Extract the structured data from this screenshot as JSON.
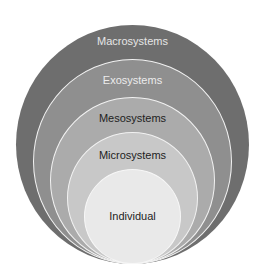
{
  "diagram": {
    "type": "nested-circles",
    "levels": [
      {
        "label": "Macrosystems",
        "fill": "#6e6e6e",
        "text_color": "#e6e6e6"
      },
      {
        "label": "Exosystems",
        "fill": "#8f8f8f",
        "text_color": "#ececec"
      },
      {
        "label": "Mesosystems",
        "fill": "#ababab",
        "text_color": "#1e1e1e"
      },
      {
        "label": "Microsystems",
        "fill": "#c8c8c8",
        "text_color": "#1e1e1e"
      },
      {
        "label": "Individual",
        "fill": "#e9e9e9",
        "text_color": "#1e1e1e"
      }
    ],
    "ring_border_color": "#f2f2f2"
  }
}
